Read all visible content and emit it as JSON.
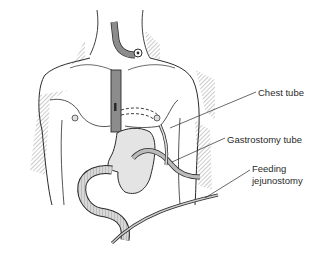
{
  "diagram": {
    "labels": [
      {
        "id": "chest-tube",
        "text": "Chest tube"
      },
      {
        "id": "gastrostomy-tube",
        "text": "Gastrostomy tube"
      },
      {
        "id": "feeding-jejunostomy-line1",
        "text": "Feeding"
      },
      {
        "id": "feeding-jejunostomy-line2",
        "text": "jejunostomy"
      }
    ],
    "colors": {
      "line": "#2a2a2a",
      "skin": "#ffffff",
      "organ": "#e6e6e6",
      "tube": "#9a9a9a",
      "hatch": "#555555"
    }
  }
}
